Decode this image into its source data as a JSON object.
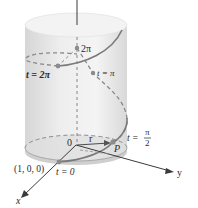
{
  "figure": {
    "type": "helix-on-cylinder",
    "colors": {
      "cylinder_fill": "#e6e6e6",
      "cylinder_top": "#f2f2f2",
      "base_disc": "#dadada",
      "curve": "#7a7a7a",
      "dashed": "#8a8a8a",
      "axis": "#3a3a3a",
      "point": "#8c8c8c"
    }
  },
  "axes": {
    "x_label": "x",
    "y_label": "y",
    "origin_label": "0"
  },
  "labels": {
    "point_100": "(1, 0, 0)",
    "t0": "t = 0",
    "t_pi_half_prefix": "t =",
    "t_pi_half_num": "π",
    "t_pi_half_den": "2",
    "P": "P",
    "r": "r",
    "t_2pi": "t = 2π",
    "z_2pi": "2π",
    "t_pi": "t = π"
  }
}
